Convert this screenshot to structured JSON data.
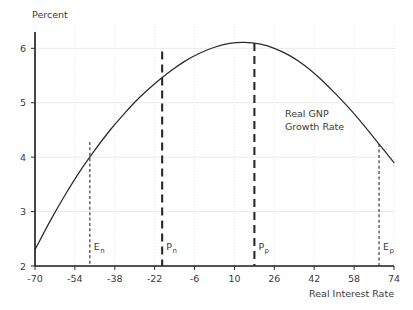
{
  "chart_data": {
    "type": "line",
    "title": "",
    "xlabel": "Real Interest Rate",
    "ylabel": "Percent",
    "xlim": [
      -70,
      74
    ],
    "ylim": [
      2,
      6.3
    ],
    "grid": true,
    "legend": "none",
    "x_ticks": [
      "-70",
      "-54",
      "-38",
      "-22",
      "-6",
      "10",
      "26",
      "42",
      "58",
      "74"
    ],
    "x_tick_values": [
      -70,
      -54,
      -38,
      -22,
      -6,
      10,
      26,
      42,
      58,
      74
    ],
    "y_ticks": [
      "2",
      "3",
      "4",
      "5",
      "6"
    ],
    "y_tick_values": [
      2,
      3,
      4,
      5,
      6
    ],
    "series": [
      {
        "name": "Real GNP Growth Rate",
        "x": [
          -70,
          -64,
          -58,
          -52,
          -46,
          -40,
          -34,
          -28,
          -22,
          -16,
          -10,
          -4,
          2,
          8,
          14,
          20,
          26,
          32,
          38,
          44,
          50,
          56,
          62,
          68,
          74
        ],
        "values": [
          2.3,
          2.82,
          3.3,
          3.74,
          4.13,
          4.49,
          4.81,
          5.1,
          5.35,
          5.57,
          5.76,
          5.91,
          6.02,
          6.09,
          6.11,
          6.08,
          6.0,
          5.87,
          5.69,
          5.46,
          5.19,
          4.9,
          4.58,
          4.24,
          3.9
        ]
      }
    ],
    "annotations": [
      {
        "name": "series-label",
        "text_line1": "Real GNP",
        "text_line2": "Growth Rate",
        "x": 38,
        "y": 4.75
      }
    ],
    "markers": [
      {
        "id": "En",
        "label": "E",
        "subscript": "n",
        "x": -48,
        "y_top": 4.28,
        "style": "thin"
      },
      {
        "id": "Pn",
        "label": "P",
        "subscript": "n",
        "x": -19,
        "y_top": 5.94,
        "style": "thick"
      },
      {
        "id": "Pp",
        "label": "P",
        "subscript": "p",
        "x": 18,
        "y_top": 6.1,
        "style": "thick"
      },
      {
        "id": "Ep",
        "label": "E",
        "subscript": "p",
        "x": 68,
        "y_top": 4.24,
        "style": "thin"
      }
    ]
  }
}
